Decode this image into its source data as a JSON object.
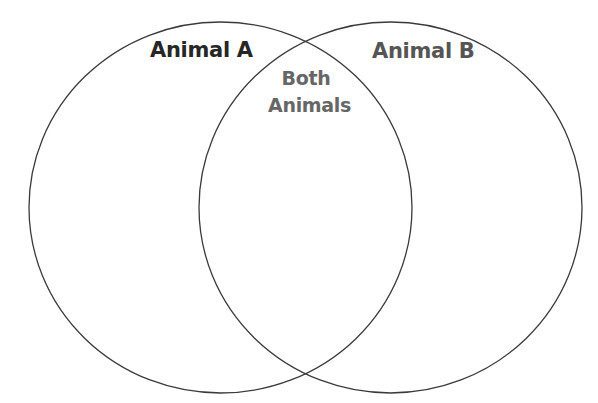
{
  "diagram": {
    "type": "venn",
    "circles": [
      {
        "id": "animal-a",
        "label": "Animal A"
      },
      {
        "id": "animal-b",
        "label": "Animal B"
      }
    ],
    "intersection": {
      "label_line1": "Both",
      "label_line2": "Animals"
    }
  },
  "colors": {
    "stroke": "#3a3a3a",
    "label_a": "#262626",
    "label_b": "#555555",
    "label_both": "#666666",
    "background": "#ffffff"
  }
}
